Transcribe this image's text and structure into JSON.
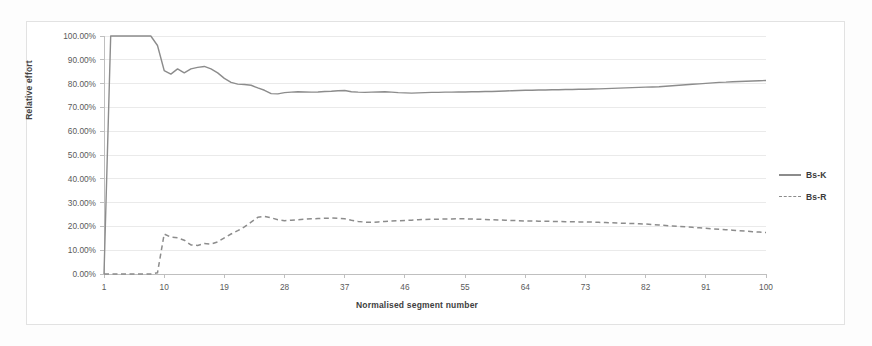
{
  "chart_data": {
    "type": "line",
    "title": "",
    "xlabel": "Normalised segment number",
    "ylabel": "Relative effort",
    "xlim": [
      1,
      100
    ],
    "ylim": [
      0,
      1
    ],
    "grid": true,
    "legend_position": "right",
    "ytick_labels": [
      "100.00%",
      "90.00%",
      "80.00%",
      "70.00%",
      "60.00%",
      "50.00%",
      "40.00%",
      "30.00%",
      "20.00%",
      "10.00%",
      "0.00%"
    ],
    "ytick_values": [
      1.0,
      0.9,
      0.8,
      0.7,
      0.6,
      0.5,
      0.4,
      0.3,
      0.2,
      0.1,
      0.0
    ],
    "xtick_labels": [
      "1",
      "10",
      "19",
      "28",
      "37",
      "46",
      "55",
      "64",
      "73",
      "82",
      "91",
      "100"
    ],
    "xtick_values": [
      1,
      10,
      19,
      28,
      37,
      46,
      55,
      64,
      73,
      82,
      91,
      100
    ],
    "x": [
      1,
      2,
      3,
      4,
      5,
      6,
      7,
      8,
      9,
      10,
      11,
      12,
      13,
      14,
      15,
      16,
      17,
      18,
      19,
      20,
      21,
      22,
      23,
      24,
      25,
      26,
      27,
      28,
      29,
      30,
      31,
      32,
      33,
      34,
      35,
      36,
      37,
      38,
      39,
      40,
      41,
      42,
      43,
      44,
      45,
      46,
      47,
      48,
      49,
      50,
      51,
      52,
      53,
      54,
      55,
      56,
      57,
      58,
      59,
      60,
      61,
      62,
      63,
      64,
      65,
      66,
      67,
      68,
      69,
      70,
      71,
      72,
      73,
      74,
      75,
      76,
      77,
      78,
      79,
      80,
      81,
      82,
      83,
      84,
      85,
      86,
      87,
      88,
      89,
      90,
      91,
      92,
      93,
      94,
      95,
      96,
      97,
      98,
      99,
      100
    ],
    "series": [
      {
        "name": "Bs-K",
        "style": "solid",
        "color": "#8c8c8c",
        "values": [
          0.0,
          1.0,
          1.0,
          1.0,
          1.0,
          1.0,
          1.0,
          1.0,
          0.96,
          0.855,
          0.84,
          0.862,
          0.845,
          0.862,
          0.868,
          0.872,
          0.862,
          0.845,
          0.822,
          0.805,
          0.798,
          0.796,
          0.793,
          0.782,
          0.772,
          0.758,
          0.757,
          0.762,
          0.764,
          0.766,
          0.765,
          0.764,
          0.765,
          0.767,
          0.768,
          0.77,
          0.771,
          0.766,
          0.764,
          0.763,
          0.764,
          0.765,
          0.766,
          0.764,
          0.762,
          0.761,
          0.76,
          0.761,
          0.762,
          0.763,
          0.763,
          0.764,
          0.764,
          0.765,
          0.765,
          0.766,
          0.766,
          0.767,
          0.767,
          0.768,
          0.769,
          0.77,
          0.771,
          0.772,
          0.772,
          0.773,
          0.773,
          0.774,
          0.774,
          0.775,
          0.775,
          0.776,
          0.776,
          0.777,
          0.778,
          0.779,
          0.78,
          0.781,
          0.782,
          0.783,
          0.784,
          0.785,
          0.786,
          0.787,
          0.789,
          0.791,
          0.793,
          0.795,
          0.797,
          0.799,
          0.801,
          0.803,
          0.805,
          0.806,
          0.808,
          0.809,
          0.81,
          0.811,
          0.812,
          0.813
        ]
      },
      {
        "name": "Bs-R",
        "style": "dashed",
        "color": "#8c8c8c",
        "values": [
          0.0,
          0.0,
          0.0,
          0.0,
          0.0,
          0.0,
          0.0,
          0.0,
          0.005,
          0.168,
          0.155,
          0.152,
          0.142,
          0.122,
          0.12,
          0.128,
          0.126,
          0.135,
          0.152,
          0.168,
          0.182,
          0.198,
          0.218,
          0.238,
          0.242,
          0.236,
          0.228,
          0.224,
          0.226,
          0.228,
          0.23,
          0.232,
          0.233,
          0.234,
          0.235,
          0.234,
          0.232,
          0.226,
          0.221,
          0.218,
          0.217,
          0.219,
          0.221,
          0.223,
          0.224,
          0.225,
          0.226,
          0.228,
          0.229,
          0.23,
          0.23,
          0.231,
          0.231,
          0.232,
          0.232,
          0.231,
          0.23,
          0.229,
          0.228,
          0.227,
          0.226,
          0.225,
          0.224,
          0.223,
          0.223,
          0.222,
          0.222,
          0.221,
          0.221,
          0.22,
          0.22,
          0.219,
          0.219,
          0.218,
          0.217,
          0.216,
          0.215,
          0.214,
          0.213,
          0.212,
          0.211,
          0.21,
          0.208,
          0.206,
          0.204,
          0.202,
          0.2,
          0.198,
          0.196,
          0.194,
          0.192,
          0.19,
          0.188,
          0.186,
          0.184,
          0.182,
          0.18,
          0.178,
          0.176,
          0.174
        ]
      }
    ],
    "legend": [
      {
        "label": "Bs-K",
        "style": "solid"
      },
      {
        "label": "Bs-R",
        "style": "dashed"
      }
    ]
  }
}
